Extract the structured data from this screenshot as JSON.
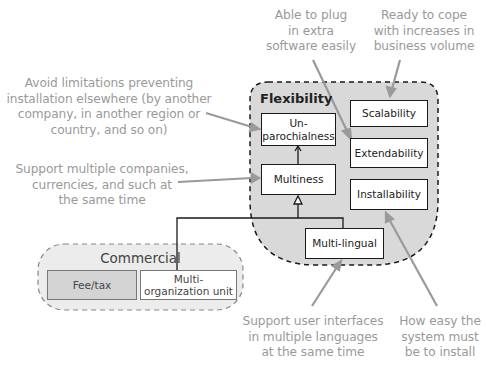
{
  "regions": {
    "flexibility": {
      "title": "Flexibility"
    },
    "commercial": {
      "title": "Commercial"
    }
  },
  "boxes": {
    "unparochialness": "Un-\nparochialness",
    "unparochialness_l1": "Un-",
    "unparochialness_l2": "parochialness",
    "multiness": "Multiness",
    "scalability": "Scalability",
    "extendability": "Extendability",
    "installability": "Installability",
    "multilingual": "Multi-lingual",
    "fee_tax": "Fee/tax",
    "multi_org_l1": "Multi-",
    "multi_org_l2": "organization unit"
  },
  "annotations": {
    "extendability": [
      "Able to plug",
      "in extra",
      "software easily"
    ],
    "scalability": [
      "Ready to cope",
      "with increases in",
      "business volume"
    ],
    "unparochialness": [
      "Avoid limitations preventing",
      "installation elsewhere (by another",
      "company, in another region or",
      "country, and so on)"
    ],
    "multiness": [
      "Support multiple companies,",
      "currencies, and such at",
      "the same time"
    ],
    "multilingual": [
      "Support user interfaces",
      "in multiple languages",
      "at the same time"
    ],
    "installability": [
      "How easy the",
      "system must",
      "be to install"
    ]
  },
  "colors": {
    "region_fill": "#d9d9d9",
    "annotation_text": "#9a9a9a",
    "arrow": "#9a9a9a",
    "box_border": "#1a1a1a"
  }
}
